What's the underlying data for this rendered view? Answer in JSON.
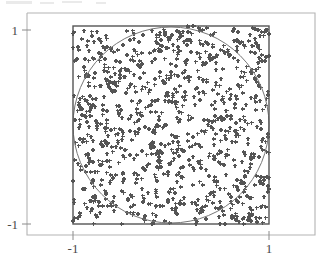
{
  "figure": {
    "title": "",
    "background_color": "#ffffff",
    "width": 330,
    "height": 264
  },
  "chart_data": {
    "type": "scatter",
    "title": "",
    "xlabel": "",
    "ylabel": "",
    "xlim": [
      -1,
      1
    ],
    "ylim": [
      -1,
      1
    ],
    "grid": false,
    "legend": null,
    "marker": "+",
    "marker_color": "#555555",
    "marker_size": 4,
    "n_points": 1000,
    "annotations": [
      {
        "kind": "circle",
        "center": [
          0,
          0
        ],
        "radius": 1,
        "stroke": "#777777",
        "fill": "none"
      },
      {
        "kind": "rect",
        "x0": -1,
        "y0": -1,
        "x1": 1,
        "y1": 1,
        "stroke": "#555555",
        "fill": "none"
      }
    ],
    "xticks": [
      -1,
      1
    ],
    "yticks": [
      -1,
      1
    ],
    "xticklabels": [
      "-1",
      "1"
    ],
    "yticklabels": [
      "-1",
      "1"
    ],
    "seed": 7,
    "axes_frame": {
      "x_range_px": [
        27,
        315
      ],
      "y_range_px": [
        13,
        235
      ],
      "data_box_px": {
        "left": 73,
        "top": 26,
        "right": 269,
        "bottom": 224
      },
      "frame_color": "#b0b0b0"
    }
  },
  "axis": {
    "y_top_label": "1",
    "y_bottom_label": "-1",
    "x_left_label": "-1",
    "x_right_label": "1"
  },
  "colors": {
    "marker": "#555555",
    "circle": "#797979",
    "data_box": "#565656",
    "outer_frame": "#b3b3b3",
    "tick": "#8a8a8a",
    "label_text": "#4a4a4a",
    "background": "#ffffff"
  }
}
